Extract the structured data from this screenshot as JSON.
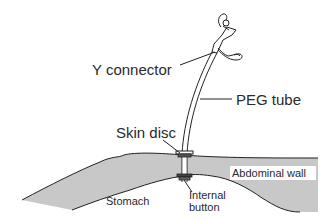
{
  "diagram": {
    "labels": {
      "y_connector": "Y connector",
      "peg_tube": "PEG tube",
      "skin_disc": "Skin disc",
      "abdominal_wall": "Abdominal wall",
      "stomach": "Stomach",
      "internal_button_line1": "Internal",
      "internal_button_line2": "button"
    },
    "colors": {
      "tissue_fill": "#c8c8c8",
      "outline": "#222222",
      "background": "#ffffff",
      "label_bg": "#ffffff"
    }
  }
}
